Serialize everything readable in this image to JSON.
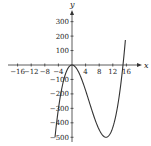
{
  "chart_data": {
    "type": "line",
    "title": "",
    "xlabel": "x",
    "ylabel": "y",
    "xlim": [
      -18,
      18
    ],
    "ylim": [
      -520,
      360
    ],
    "grid": false,
    "legend": null,
    "x_ticks": [
      -16,
      -12,
      -8,
      -4,
      4,
      8,
      12,
      16
    ],
    "x_tick_labels": [
      "−16",
      "−12",
      "−8",
      "−4",
      "4",
      "8",
      "12",
      "16"
    ],
    "y_ticks": [
      300,
      200,
      100,
      -100,
      -200,
      -300,
      -400,
      -500
    ],
    "y_tick_labels": [
      "300",
      "200",
      "100",
      "−100",
      "−200",
      "−300",
      "−400",
      "−500"
    ],
    "series": [
      {
        "name": "f(x) = x^3 - 15x^2",
        "x": [
          -5,
          -4,
          -3,
          -2,
          -1,
          0,
          1,
          2,
          4,
          6,
          8,
          10,
          12,
          14,
          15,
          15.7
        ],
        "y": [
          -500,
          -304,
          -162,
          -68,
          -16,
          0,
          -14,
          -52,
          -176,
          -324,
          -448,
          -500,
          -432,
          -196,
          0,
          173
        ]
      }
    ],
    "features": {
      "local_max": [
        0,
        0
      ],
      "local_min": [
        10,
        -500
      ],
      "roots": [
        0,
        15
      ]
    }
  }
}
